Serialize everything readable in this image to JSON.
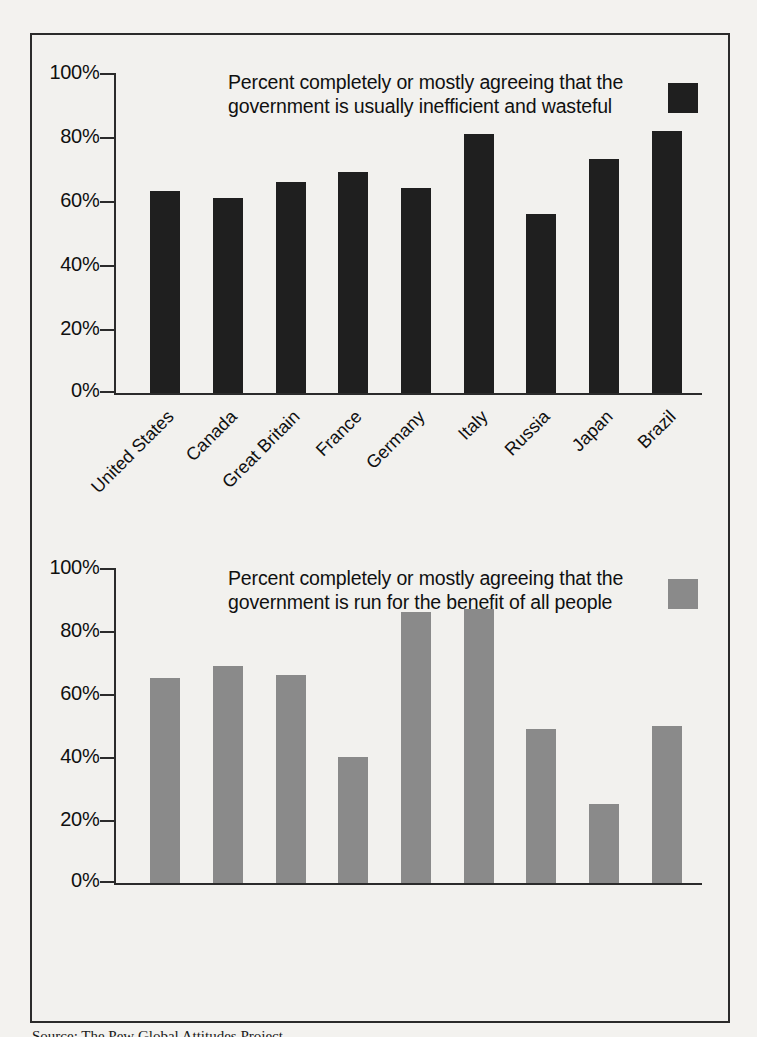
{
  "page": {
    "background_color": "#f3f2ef",
    "frame_border_color": "#2b2b2b",
    "source_note": "Source: The Pew Global Attitudes Project"
  },
  "axis": {
    "tick_labels": [
      "100%",
      "80%",
      "60%",
      "40%",
      "20%",
      "0%"
    ],
    "tick_values": [
      100,
      80,
      60,
      40,
      20,
      0
    ]
  },
  "categories": [
    "United States",
    "Canada",
    "Great Britain",
    "France",
    "Germany",
    "Italy",
    "Russia",
    "Japan",
    "Brazil"
  ],
  "panels": [
    {
      "id": "inefficient-wasteful",
      "legend_text": "Percent completely or mostly agreeing that the government is usually inefficient and wasteful",
      "swatch_color": "#1f1f1f"
    },
    {
      "id": "benefit-all-people",
      "legend_text": "Percent completely or mostly agreeing that the government is run for the benefit of all people",
      "swatch_color": "#8a8a8a"
    }
  ],
  "chart_data": [
    {
      "type": "bar",
      "title": "Percent completely or mostly agreeing that the government is usually inefficient and wasteful",
      "xlabel": "",
      "ylabel": "",
      "ylim": [
        0,
        100
      ],
      "ytick_labels": [
        "0%",
        "20%",
        "40%",
        "60%",
        "80%",
        "100%"
      ],
      "grid": false,
      "legend_position": "top-right",
      "bar_color": "#1f1f1f",
      "categories": [
        "United States",
        "Canada",
        "Great Britain",
        "France",
        "Germany",
        "Italy",
        "Russia",
        "Japan",
        "Brazil"
      ],
      "values": [
        63,
        61,
        66,
        69,
        64,
        81,
        56,
        73,
        82
      ]
    },
    {
      "type": "bar",
      "title": "Percent completely or mostly agreeing that the government is run for the benefit of all people",
      "xlabel": "",
      "ylabel": "",
      "ylim": [
        0,
        100
      ],
      "ytick_labels": [
        "0%",
        "20%",
        "40%",
        "60%",
        "80%",
        "100%"
      ],
      "grid": false,
      "legend_position": "top-right",
      "bar_color": "#8a8a8a",
      "categories": [
        "United States",
        "Canada",
        "Great Britain",
        "France",
        "Germany",
        "Italy",
        "Russia",
        "Japan",
        "Brazil"
      ],
      "values": [
        65,
        69,
        66,
        40,
        86,
        87,
        49,
        25,
        50
      ]
    }
  ]
}
